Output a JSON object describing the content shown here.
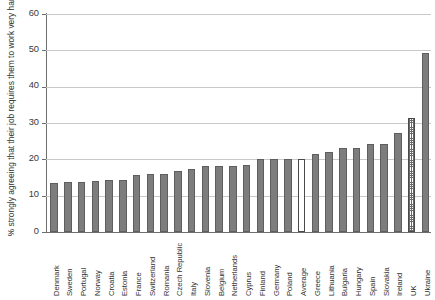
{
  "chart_data": {
    "type": "bar",
    "title": "",
    "subtitle": "",
    "xlabel": "",
    "ylabel": "% strongly agreeing that their job requires them to work very hard",
    "ylim": [
      0,
      60
    ],
    "ytick_values": [
      0,
      10,
      20,
      30,
      40,
      50,
      60
    ],
    "ytick_labels": [
      "0",
      "10",
      "20",
      "30",
      "40",
      "50",
      "60"
    ],
    "grid": "horizontal",
    "legend": "none",
    "categories": [
      "Denmark",
      "Sweden",
      "Portugal",
      "Norway",
      "Croatia",
      "Estonia",
      "France",
      "Switzerland",
      "Romania",
      "Czech Republic",
      "Italy",
      "Slovenia",
      "Belgium",
      "Netherlands",
      "Cyprus",
      "Finland",
      "Germany",
      "Poland",
      "Average",
      "Greece",
      "Lithuania",
      "Bulgaria",
      "Hungary",
      "Spain",
      "Slovakia",
      "Ireland",
      "UK",
      "Ukraine"
    ],
    "values": [
      13.5,
      13.7,
      13.8,
      14.0,
      14.2,
      14.4,
      15.6,
      16.0,
      16.0,
      16.7,
      17.4,
      18.2,
      18.2,
      18.2,
      18.4,
      20.0,
      20.0,
      20.0,
      20.2,
      21.5,
      22.0,
      23.0,
      23.1,
      24.2,
      24.3,
      27.2,
      31.5,
      49.3
    ],
    "bar_styles": [
      "solid",
      "solid",
      "solid",
      "solid",
      "solid",
      "solid",
      "solid",
      "solid",
      "solid",
      "solid",
      "solid",
      "solid",
      "solid",
      "solid",
      "solid",
      "solid",
      "solid",
      "solid",
      "open",
      "solid",
      "solid",
      "solid",
      "solid",
      "solid",
      "solid",
      "solid",
      "dotted",
      "solid"
    ],
    "colors": {
      "bar_fill": "#7d7d7d",
      "bar_edge": "#5e5e5e",
      "highlight_fill": "#ffffff",
      "highlight_edge": "#4a4a4a",
      "gridline": "#c9c9c9",
      "axis": "#6e6e6e",
      "text": "#2f2f2f",
      "background": "#ffffff"
    }
  }
}
